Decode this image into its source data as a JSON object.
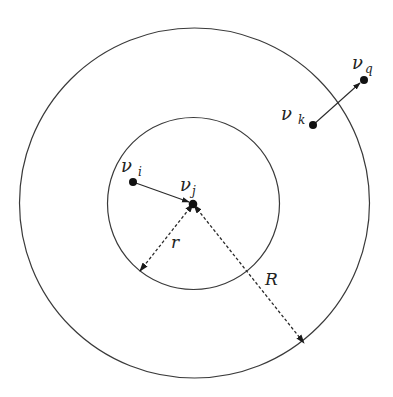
{
  "diagram": {
    "circles": [
      {
        "name": "inner-circle",
        "radius_label": "r"
      },
      {
        "name": "outer-circle",
        "radius_label": "R"
      }
    ],
    "nodes": [
      {
        "id": "vi",
        "symbol": "ν",
        "subscript": "i"
      },
      {
        "id": "vj",
        "symbol": "ν",
        "subscript": "j"
      },
      {
        "id": "vk",
        "symbol": "ν",
        "subscript": "k"
      },
      {
        "id": "vq",
        "symbol": "ν",
        "subscript": "q"
      }
    ],
    "edges": [
      {
        "from": "vi",
        "to": "vj",
        "style": "solid-arrow"
      },
      {
        "from": "vk",
        "to": "vq",
        "style": "solid-arrow"
      }
    ],
    "radius_labels": {
      "inner": "r",
      "outer": "R"
    },
    "colors": {
      "stroke": "#3a3a3a",
      "node": "#111111",
      "background": "#ffffff"
    }
  }
}
